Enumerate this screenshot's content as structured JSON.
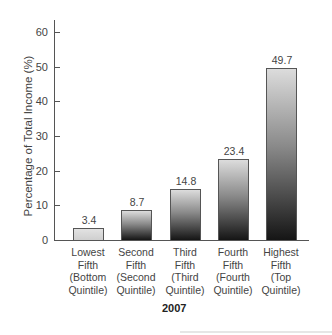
{
  "chart_data": {
    "type": "bar",
    "title": "",
    "xlabel": "2007",
    "ylabel": "Percentage of Total Income (%)",
    "ylim": [
      0,
      60
    ],
    "yticks": [
      0,
      10,
      20,
      30,
      40,
      50,
      60
    ],
    "grid": false,
    "legend": null,
    "categories": [
      "Lowest Fifth (Bottom Quintile)",
      "Second Fifth (Second Quintile)",
      "Third Fifth (Third Quintile)",
      "Fourth Fifth (Fourth Quintile)",
      "Highest Fifth (Top Quintile)"
    ],
    "values": [
      3.4,
      8.7,
      14.8,
      23.4,
      49.7
    ],
    "value_labels": [
      "3.4",
      "8.7",
      "14.8",
      "23.4",
      "49.7"
    ]
  },
  "axis": {
    "ytick_labels": [
      "0",
      "10",
      "20",
      "30",
      "40",
      "50",
      "60"
    ]
  },
  "labels": {
    "cat0": [
      "Lowest",
      "Fifth",
      "(Bottom",
      "Quintile)"
    ],
    "cat1": [
      "Second",
      "Fifth",
      "(Second",
      "Quintile)"
    ],
    "cat2": [
      "Third",
      "Fifth",
      "(Third",
      "Quintile)"
    ],
    "cat3": [
      "Fourth",
      "Fifth",
      "(Fourth",
      "Quintile)"
    ],
    "cat4": [
      "Highest",
      "Fifth",
      "(Top",
      "Quintile)"
    ]
  },
  "colors": {
    "bar_top": "#dcdcdc",
    "bar_bottom": "#151515",
    "axis": "#555555"
  }
}
